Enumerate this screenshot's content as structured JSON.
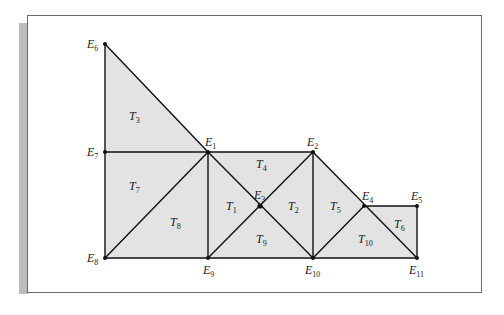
{
  "figure": {
    "fill_color": "#e3e3e3",
    "edge_color": "#111111",
    "frame_color": "#6a6a6a",
    "shadow_color": "#bdbdbd",
    "nodes": [
      {
        "id": "E1",
        "letter": "E",
        "sub": "1",
        "x": 208,
        "y": 152,
        "lx": 205,
        "ly": 136
      },
      {
        "id": "E2",
        "letter": "E",
        "sub": "2",
        "x": 313,
        "y": 152,
        "lx": 307,
        "ly": 136
      },
      {
        "id": "E3",
        "letter": "E",
        "sub": "3",
        "x": 260,
        "y": 206,
        "lx": 254,
        "ly": 189
      },
      {
        "id": "E4",
        "letter": "E",
        "sub": "4",
        "x": 364,
        "y": 206,
        "lx": 362,
        "ly": 190
      },
      {
        "id": "E5",
        "letter": "E",
        "sub": "5",
        "x": 417,
        "y": 206,
        "lx": 411,
        "ly": 190
      },
      {
        "id": "E6",
        "letter": "E",
        "sub": "6",
        "x": 105,
        "y": 44,
        "lx": 87,
        "ly": 38
      },
      {
        "id": "E7",
        "letter": "E",
        "sub": "7",
        "x": 105,
        "y": 152,
        "lx": 87,
        "ly": 146
      },
      {
        "id": "E8",
        "letter": "E",
        "sub": "8",
        "x": 105,
        "y": 258,
        "lx": 87,
        "ly": 252
      },
      {
        "id": "E9",
        "letter": "E",
        "sub": "9",
        "x": 208,
        "y": 258,
        "lx": 203,
        "ly": 264
      },
      {
        "id": "E10",
        "letter": "E",
        "sub": "10",
        "x": 313,
        "y": 258,
        "lx": 305,
        "ly": 264
      },
      {
        "id": "E11",
        "letter": "E",
        "sub": "11",
        "x": 417,
        "y": 258,
        "lx": 409,
        "ly": 264
      }
    ],
    "triangles": [
      {
        "id": "T1",
        "letter": "T",
        "sub": "1",
        "nodes": [
          "E1",
          "E3",
          "E9"
        ],
        "lx": 226,
        "ly": 200
      },
      {
        "id": "T2",
        "letter": "T",
        "sub": "2",
        "nodes": [
          "E2",
          "E3",
          "E10"
        ],
        "lx": 288,
        "ly": 200
      },
      {
        "id": "T3",
        "letter": "T",
        "sub": "3",
        "nodes": [
          "E6",
          "E7",
          "E1"
        ],
        "lx": 129,
        "ly": 110
      },
      {
        "id": "T4",
        "letter": "T",
        "sub": "4",
        "nodes": [
          "E1",
          "E2",
          "E3"
        ],
        "lx": 256,
        "ly": 158
      },
      {
        "id": "T5",
        "letter": "T",
        "sub": "5",
        "nodes": [
          "E2",
          "E4",
          "E10"
        ],
        "lx": 330,
        "ly": 200
      },
      {
        "id": "T6",
        "letter": "T",
        "sub": "6",
        "nodes": [
          "E4",
          "E5",
          "E11"
        ],
        "lx": 394,
        "ly": 218
      },
      {
        "id": "T7",
        "letter": "T",
        "sub": "7",
        "nodes": [
          "E7",
          "E1",
          "E8"
        ],
        "lx": 129,
        "ly": 180
      },
      {
        "id": "T8",
        "letter": "T",
        "sub": "8",
        "nodes": [
          "E1",
          "E8",
          "E9"
        ],
        "lx": 170,
        "ly": 216
      },
      {
        "id": "T9",
        "letter": "T",
        "sub": "9",
        "nodes": [
          "E3",
          "E9",
          "E10"
        ],
        "lx": 256,
        "ly": 233
      },
      {
        "id": "T10",
        "letter": "T",
        "sub": "10",
        "nodes": [
          "E4",
          "E10",
          "E11"
        ],
        "lx": 358,
        "ly": 233
      }
    ],
    "edges": [
      [
        "E6",
        "E8"
      ],
      [
        "E6",
        "E1"
      ],
      [
        "E7",
        "E1"
      ],
      [
        "E1",
        "E2"
      ],
      [
        "E8",
        "E11"
      ],
      [
        "E1",
        "E9"
      ],
      [
        "E2",
        "E10"
      ],
      [
        "E5",
        "E11"
      ],
      [
        "E4",
        "E5"
      ],
      [
        "E8",
        "E1"
      ],
      [
        "E1",
        "E10"
      ],
      [
        "E9",
        "E2"
      ],
      [
        "E2",
        "E11"
      ],
      [
        "E10",
        "E4"
      ]
    ]
  }
}
